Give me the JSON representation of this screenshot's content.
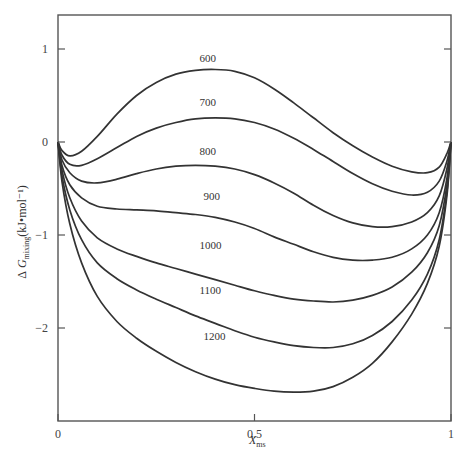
{
  "chart_data": {
    "type": "line",
    "title": "",
    "xlabel": "X_ms",
    "ylabel": "ΔG_mixing(kJ•mol⁻¹)",
    "xlim": [
      0,
      1
    ],
    "ylim": [
      -3.0,
      1.38
    ],
    "grid": false,
    "legend": "inline labels",
    "x_ticks": [
      "0",
      "0.5",
      "1"
    ],
    "y_ticks": [
      "1",
      "0",
      "-1",
      "-2"
    ],
    "x": [
      0,
      0.01,
      0.03,
      0.06,
      0.1,
      0.15,
      0.2,
      0.25,
      0.3,
      0.35,
      0.4,
      0.45,
      0.5,
      0.55,
      0.6,
      0.65,
      0.7,
      0.75,
      0.8,
      0.85,
      0.9,
      0.94,
      0.97,
      0.99,
      1
    ],
    "series": [
      {
        "name": "600",
        "label_pos": [
          0.36,
          0.86
        ],
        "values": [
          0,
          -0.09,
          -0.15,
          -0.1,
          0.06,
          0.3,
          0.5,
          0.64,
          0.73,
          0.77,
          0.78,
          0.76,
          0.69,
          0.57,
          0.42,
          0.26,
          0.1,
          -0.04,
          -0.16,
          -0.26,
          -0.32,
          -0.33,
          -0.27,
          -0.12,
          0
        ]
      },
      {
        "name": "700",
        "label_pos": [
          0.36,
          0.39
        ],
        "values": [
          0,
          -0.14,
          -0.24,
          -0.25,
          -0.18,
          -0.06,
          0.06,
          0.15,
          0.21,
          0.25,
          0.26,
          0.25,
          0.21,
          0.14,
          0.04,
          -0.08,
          -0.21,
          -0.34,
          -0.45,
          -0.53,
          -0.57,
          -0.54,
          -0.42,
          -0.2,
          0
        ]
      },
      {
        "name": "800",
        "label_pos": [
          0.36,
          -0.14
        ],
        "values": [
          0,
          -0.19,
          -0.33,
          -0.42,
          -0.44,
          -0.4,
          -0.34,
          -0.29,
          -0.26,
          -0.25,
          -0.26,
          -0.29,
          -0.35,
          -0.44,
          -0.55,
          -0.68,
          -0.79,
          -0.87,
          -0.91,
          -0.91,
          -0.86,
          -0.76,
          -0.58,
          -0.28,
          0
        ]
      },
      {
        "name": "900",
        "label_pos": [
          0.37,
          -0.62
        ],
        "values": [
          0,
          -0.25,
          -0.46,
          -0.6,
          -0.69,
          -0.72,
          -0.73,
          -0.74,
          -0.76,
          -0.78,
          -0.81,
          -0.86,
          -0.93,
          -1.02,
          -1.1,
          -1.18,
          -1.24,
          -1.27,
          -1.27,
          -1.24,
          -1.15,
          -1.0,
          -0.76,
          -0.38,
          0
        ]
      },
      {
        "name": "1000",
        "label_pos": [
          0.36,
          -1.15
        ],
        "values": [
          0,
          -0.3,
          -0.6,
          -0.85,
          -1.03,
          -1.15,
          -1.23,
          -1.3,
          -1.36,
          -1.42,
          -1.48,
          -1.54,
          -1.6,
          -1.65,
          -1.69,
          -1.71,
          -1.72,
          -1.7,
          -1.65,
          -1.56,
          -1.4,
          -1.19,
          -0.9,
          -0.45,
          0
        ]
      },
      {
        "name": "1100",
        "label_pos": [
          0.36,
          -1.63
        ],
        "values": [
          0,
          -0.36,
          -0.73,
          -1.05,
          -1.3,
          -1.47,
          -1.59,
          -1.69,
          -1.78,
          -1.87,
          -1.95,
          -2.03,
          -2.1,
          -2.15,
          -2.19,
          -2.21,
          -2.21,
          -2.17,
          -2.08,
          -1.93,
          -1.7,
          -1.42,
          -1.05,
          -0.52,
          0
        ]
      },
      {
        "name": "1200",
        "label_pos": [
          0.37,
          -2.13
        ],
        "values": [
          0,
          -0.42,
          -0.88,
          -1.3,
          -1.66,
          -1.93,
          -2.11,
          -2.25,
          -2.37,
          -2.47,
          -2.55,
          -2.61,
          -2.65,
          -2.68,
          -2.69,
          -2.68,
          -2.63,
          -2.53,
          -2.38,
          -2.15,
          -1.85,
          -1.52,
          -1.12,
          -0.56,
          0
        ]
      }
    ],
    "colors": {
      "line": "#333333",
      "axis": "#555555",
      "background": "#ffffff"
    }
  }
}
